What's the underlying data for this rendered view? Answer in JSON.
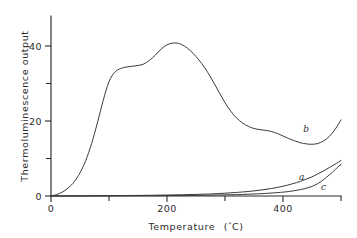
{
  "chart_data": {
    "type": "line",
    "title": "",
    "xlabel": "Temperature (°C)",
    "ylabel": "Thermoluminescence output",
    "xlim": [
      0,
      500
    ],
    "ylim": [
      0,
      48
    ],
    "grid": false,
    "legend_position": "inline-curve-labels",
    "x_ticks_major": [
      0,
      200,
      400
    ],
    "x_tick_labels": [
      "0",
      "200",
      "400"
    ],
    "x_ticks_minor": [
      100,
      300,
      500
    ],
    "y_ticks_major": [
      0,
      20,
      40
    ],
    "y_tick_labels": [
      "0",
      "20",
      "40"
    ],
    "y_ticks_minor": [
      10,
      30
    ],
    "series": [
      {
        "name": "b",
        "label": "b",
        "label_x": 440,
        "label_y": 17,
        "x": [
          0,
          10,
          20,
          30,
          40,
          50,
          60,
          70,
          80,
          90,
          100,
          110,
          120,
          130,
          140,
          150,
          160,
          170,
          180,
          190,
          200,
          210,
          220,
          230,
          240,
          250,
          260,
          270,
          280,
          290,
          300,
          310,
          320,
          330,
          340,
          350,
          360,
          370,
          380,
          390,
          400,
          410,
          420,
          430,
          440,
          450,
          460,
          470,
          480,
          490,
          500
        ],
        "y": [
          0,
          0.4,
          1.1,
          2.2,
          3.8,
          6.2,
          9.5,
          14.0,
          19.5,
          25.5,
          30.5,
          33.0,
          34.0,
          34.4,
          34.6,
          34.8,
          35.2,
          36.2,
          37.6,
          39.2,
          40.3,
          40.8,
          40.7,
          40.0,
          38.8,
          37.2,
          35.3,
          33.0,
          30.4,
          27.6,
          24.9,
          22.6,
          20.8,
          19.5,
          18.6,
          18.0,
          17.7,
          17.5,
          17.2,
          16.7,
          16.0,
          15.3,
          14.7,
          14.2,
          13.9,
          13.8,
          14.0,
          14.7,
          15.9,
          17.8,
          20.3
        ]
      },
      {
        "name": "a",
        "label": "a",
        "label_x": 432,
        "label_y": 4.2,
        "x": [
          0,
          25,
          50,
          75,
          100,
          125,
          150,
          175,
          200,
          225,
          250,
          275,
          300,
          320,
          340,
          360,
          380,
          400,
          415,
          430,
          440,
          450,
          460,
          470,
          480,
          490,
          500
        ],
        "y": [
          0,
          0.02,
          0.04,
          0.06,
          0.09,
          0.12,
          0.16,
          0.2,
          0.26,
          0.33,
          0.42,
          0.55,
          0.75,
          0.95,
          1.2,
          1.55,
          2.0,
          2.6,
          3.2,
          3.9,
          4.5,
          5.1,
          5.9,
          6.7,
          7.6,
          8.5,
          9.5
        ]
      },
      {
        "name": "c",
        "label": "c",
        "label_x": 470,
        "label_y": 1.6,
        "x": [
          0,
          50,
          100,
          150,
          200,
          250,
          300,
          330,
          360,
          390,
          410,
          430,
          445,
          455,
          465,
          475,
          485,
          495,
          500
        ],
        "y": [
          0,
          0.02,
          0.04,
          0.07,
          0.11,
          0.18,
          0.3,
          0.42,
          0.6,
          0.9,
          1.2,
          1.7,
          2.3,
          2.9,
          3.8,
          5.0,
          6.3,
          7.8,
          8.4
        ]
      }
    ]
  },
  "axis": {
    "x_title": "Temperature",
    "x_unit_open": "(",
    "x_unit_deg": "°",
    "x_unit_c": "C",
    "x_unit_close": ")",
    "y_title": "Thermoluminescence output"
  }
}
